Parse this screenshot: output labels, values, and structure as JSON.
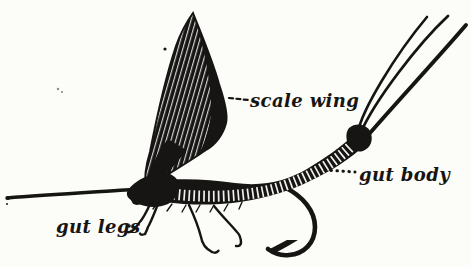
{
  "colors": {
    "paper": "#fcfcf8",
    "ink": "#171513"
  },
  "figure": {
    "labels": {
      "wing": "scale wing",
      "body": "gut body",
      "legs": "gut legs"
    }
  }
}
